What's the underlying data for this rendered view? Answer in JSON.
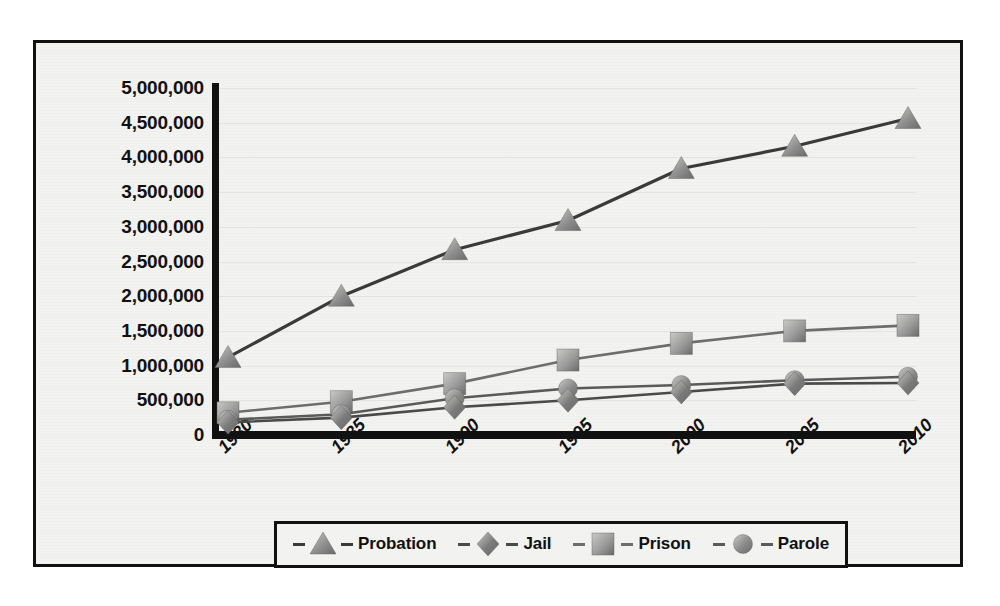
{
  "chart_data": {
    "type": "line",
    "title": "",
    "subtitle": "",
    "xlabel": "",
    "ylabel": "",
    "categories": [
      "1980",
      "1985",
      "1990",
      "1995",
      "2000",
      "2005",
      "2010"
    ],
    "x": [
      1980,
      1985,
      1990,
      1995,
      2000,
      2005,
      2010
    ],
    "ylim": [
      0,
      5000000
    ],
    "xlim": [
      1980,
      2010
    ],
    "ytick_labels": [
      "0",
      "500,000",
      "1,000,000",
      "1,500,000",
      "2,000,000",
      "2,500,000",
      "3,000,000",
      "3,500,000",
      "4,000,000",
      "4,500,000",
      "5,000,000"
    ],
    "ytick_values": [
      0,
      500000,
      1000000,
      1500000,
      2000000,
      2500000,
      3000000,
      3500000,
      4000000,
      4500000,
      5000000
    ],
    "grid": true,
    "legend_position": "bottom",
    "series": [
      {
        "name": "Probation",
        "marker": "triangle",
        "color": "#8e8e8e",
        "line_color": "#3a3a3a",
        "values": [
          1118000,
          2000000,
          2670000,
          3090000,
          3840000,
          4160000,
          4560000
        ]
      },
      {
        "name": "Jail",
        "marker": "diamond",
        "color": "#7a7a7a",
        "line_color": "#4a4a4a",
        "values": [
          182000,
          250000,
          400000,
          500000,
          620000,
          740000,
          750000
        ]
      },
      {
        "name": "Prison",
        "marker": "square",
        "color": "#9b9b9b",
        "line_color": "#6d6d6d",
        "values": [
          320000,
          480000,
          740000,
          1080000,
          1320000,
          1500000,
          1580000
        ]
      },
      {
        "name": "Parole",
        "marker": "circle",
        "color": "#8a8a8a",
        "line_color": "#5a5a5a",
        "values": [
          220000,
          300000,
          530000,
          670000,
          720000,
          790000,
          840000
        ]
      }
    ]
  },
  "legend": {
    "items": [
      {
        "label": "Probation",
        "marker": "triangle-marker-icon"
      },
      {
        "label": "Jail",
        "marker": "diamond-marker-icon"
      },
      {
        "label": "Prison",
        "marker": "square-marker-icon"
      },
      {
        "label": "Parole",
        "marker": "circle-marker-icon"
      }
    ]
  },
  "colors": {
    "frame": "#111111",
    "plot_background": "#f2f2f0",
    "axis": "#111111",
    "gridline": "#d8d8d6"
  }
}
